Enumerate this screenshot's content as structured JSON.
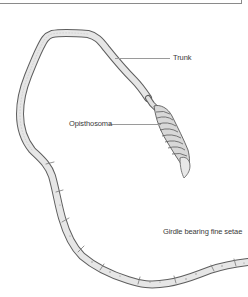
{
  "figure": {
    "labels": [
      {
        "id": "trunk",
        "text": "Trunk"
      },
      {
        "id": "opisthosoma",
        "text": "Opisthosoma"
      },
      {
        "id": "girdle",
        "text": "Girdle bearing fine setae"
      }
    ]
  },
  "colors": {
    "body_fill": "#e4e4e4",
    "body_outline": "#6a6a6a",
    "label_text": "#3a3a3a",
    "leader_line": "#9a9a9a",
    "frame": "#8a8a8a"
  }
}
